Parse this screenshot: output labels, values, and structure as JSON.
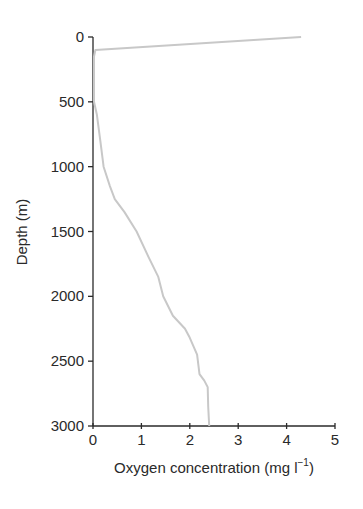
{
  "chart_data": {
    "type": "line",
    "title": "",
    "xlabel": "Oxygen concentration (mg l⁻¹)",
    "xlabel_main": "Oxygen concentration (mg l",
    "xlabel_sup": "−1",
    "xlabel_close": ")",
    "ylabel": "Depth (m)",
    "xlim": [
      0,
      5
    ],
    "ylim": [
      3000,
      0
    ],
    "y_inverted": true,
    "grid": false,
    "legend": null,
    "x_ticks": [
      "0",
      "1",
      "2",
      "3",
      "4",
      "5"
    ],
    "y_ticks": [
      "0",
      "500",
      "1000",
      "1500",
      "2000",
      "2500",
      "3000"
    ],
    "line_color": "#c8c8c8",
    "series": [
      {
        "name": "Oxygen profile",
        "points": [
          {
            "x": 4.3,
            "y": 0
          },
          {
            "x": 0.05,
            "y": 100
          },
          {
            "x": 0.02,
            "y": 150
          },
          {
            "x": 0.02,
            "y": 500
          },
          {
            "x": 0.08,
            "y": 600
          },
          {
            "x": 0.15,
            "y": 800
          },
          {
            "x": 0.22,
            "y": 1000
          },
          {
            "x": 0.35,
            "y": 1150
          },
          {
            "x": 0.45,
            "y": 1250
          },
          {
            "x": 0.65,
            "y": 1350
          },
          {
            "x": 0.9,
            "y": 1500
          },
          {
            "x": 1.15,
            "y": 1700
          },
          {
            "x": 1.35,
            "y": 1850
          },
          {
            "x": 1.45,
            "y": 2000
          },
          {
            "x": 1.65,
            "y": 2150
          },
          {
            "x": 1.9,
            "y": 2250
          },
          {
            "x": 2.0,
            "y": 2320
          },
          {
            "x": 2.15,
            "y": 2450
          },
          {
            "x": 2.2,
            "y": 2600
          },
          {
            "x": 2.3,
            "y": 2650
          },
          {
            "x": 2.37,
            "y": 2700
          },
          {
            "x": 2.38,
            "y": 2850
          },
          {
            "x": 2.4,
            "y": 3000
          }
        ]
      }
    ]
  }
}
